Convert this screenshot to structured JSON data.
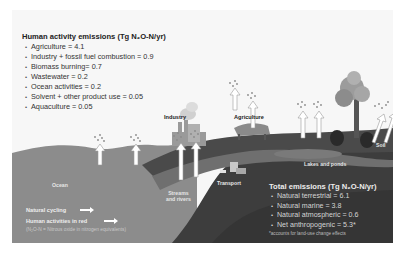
{
  "human_activity": {
    "title": "Human activity emissions (Tg N₂O-N/yr)",
    "items": [
      "Agriculture = 4.1",
      "Industry + fossil fuel combustion = 0.9",
      "Biomass burning= 0.7",
      "Wastewater = 0.2",
      "Ocean activities = 0.2",
      "Solvent + other product use = 0.05",
      "Aquaculture = 0.05"
    ]
  },
  "total_emissions": {
    "title": "Total emissions (Tg N₂O-N/yr)",
    "items": [
      "Natural terrestrial = 6.1",
      "Natural marine = 3.8",
      "Natural atmospheric = 0.6",
      "Net anthropogenic = 5.3*"
    ],
    "footnote": "*accounts for land-use change effects"
  },
  "scene_labels": {
    "industry": "Industry",
    "agriculture": "Agriculture",
    "soil": "Soil",
    "lakes": "Lakes and ponds",
    "ocean": "Ocean",
    "streams_line1": "Streams",
    "streams_line2": "and rivers",
    "transport": "Transport"
  },
  "legend": {
    "natural": "Natural cycling",
    "human": "Human activities in red",
    "note": "(N₂O-N = Nitrous oxide in nitrogen equivalents)"
  },
  "colors": {
    "ocean": "#8a8a8a",
    "land_dark": "#3c3c3c",
    "land_mid": "#555555",
    "river": "#6e6e6e",
    "sky": "#f7f7f7"
  }
}
